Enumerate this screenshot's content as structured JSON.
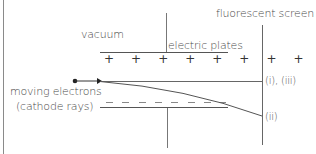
{
  "diagram": {
    "labels": {
      "vacuum": "vacuum",
      "electric_plates": "electric plates",
      "fluorescent_screen": "fluorescent screen",
      "moving_electrons_line1": "moving electrons",
      "moving_electrons_line2": "(cathode rays)",
      "path_straight": "(i), (iii)",
      "path_deflected": "(ii)"
    },
    "plates": {
      "top_charge": "+ + + + + + + +",
      "bottom_charge": "– – – – – – – –",
      "top_sign_count": 8,
      "bottom_sign_count": 8
    },
    "colors": {
      "line": "#555555",
      "text": "#4a4a4a",
      "dash": "#888888",
      "electron": "#222222",
      "background": "#ffffff"
    }
  }
}
